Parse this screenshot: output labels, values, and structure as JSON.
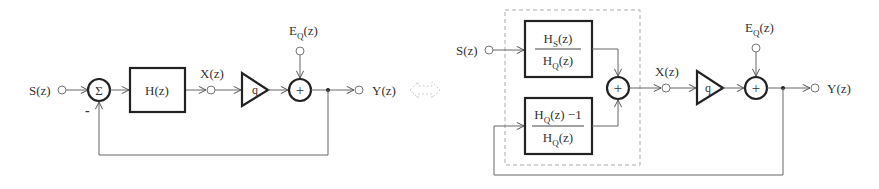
{
  "left_diagram": {
    "input_label": "S(z)",
    "summer_symbol": "Σ",
    "minus_sign": "-",
    "filter_label": "H(z)",
    "intermediate_label": "X(z)",
    "quantizer_label": "q",
    "error_label": "E",
    "error_sub": "Q",
    "error_suffix": "(z)",
    "adder_symbol": "+",
    "output_label": "Y(z)"
  },
  "equivalence_symbol": "⇔",
  "right_diagram": {
    "input_label": "S(z)",
    "top_block": {
      "num_main": "H",
      "num_sub": "S",
      "num_suffix": "(z)",
      "den_main": "H",
      "den_sub": "Q",
      "den_suffix": "(z)"
    },
    "bottom_block": {
      "num_main": "H",
      "num_sub": "Q",
      "num_suffix": "(z) −1",
      "den_main": "H",
      "den_sub": "Q",
      "den_suffix": "(z)"
    },
    "inner_adder_symbol": "+",
    "intermediate_label": "X(z)",
    "quantizer_label": "q",
    "error_label": "E",
    "error_sub": "Q",
    "error_suffix": "(z)",
    "adder_symbol": "+",
    "output_label": "Y(z)"
  }
}
